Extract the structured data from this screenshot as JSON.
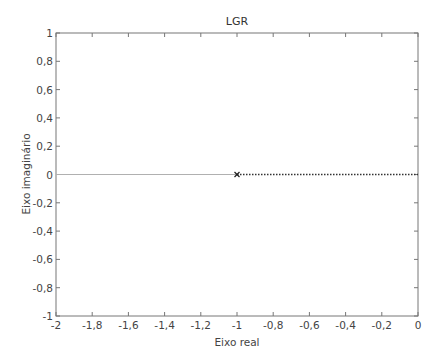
{
  "chart_data": {
    "type": "line",
    "title": "LGR",
    "xlabel": "Eixo real",
    "ylabel": "Eixo imaginário",
    "xlim": [
      -2,
      0
    ],
    "ylim": [
      -1,
      1
    ],
    "grid": false,
    "x_ticks": [
      "-2",
      "-1,8",
      "-1,6",
      "-1,4",
      "-1,2",
      "-1",
      "-0,8",
      "-0,6",
      "-0,4",
      "-0,2",
      "0"
    ],
    "y_ticks": [
      "1",
      "0,8",
      "0,6",
      "0,4",
      "0,2",
      "0",
      "-0,2",
      "-0,4",
      "-0,6",
      "-0,8",
      "-1"
    ],
    "series": [
      {
        "name": "root-locus-branch-left",
        "style": "solid",
        "color": "#b0b0b0",
        "x": [
          -2,
          -1
        ],
        "y": [
          0,
          0
        ]
      },
      {
        "name": "root-locus-branch-right",
        "style": "dotted",
        "color": "#333333",
        "x": [
          -1,
          0
        ],
        "y": [
          0,
          0
        ]
      }
    ],
    "markers": [
      {
        "type": "x",
        "label": "pole",
        "x": -1,
        "y": 0
      }
    ]
  }
}
